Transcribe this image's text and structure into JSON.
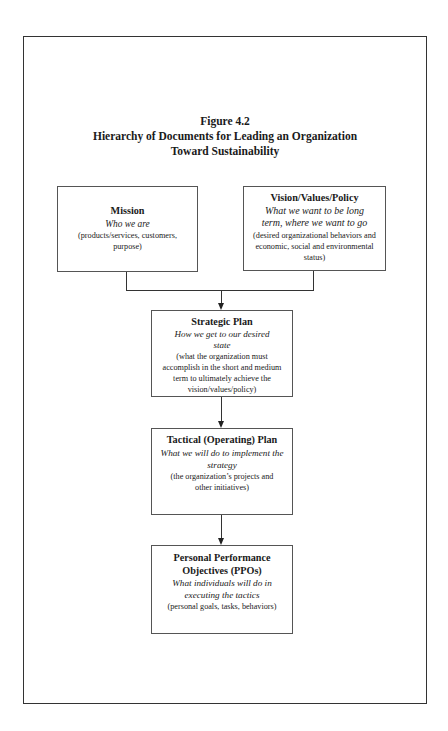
{
  "figure": {
    "number": "Figure 4.2",
    "title_line1": "Hierarchy of Documents for Leading an Organization",
    "title_line2": "Toward Sustainability"
  },
  "boxes": {
    "mission": {
      "heading": "Mission",
      "subtitle": "Who we are",
      "description": "(products/services, customers, purpose)"
    },
    "vision": {
      "heading": "Vision/Values/Policy",
      "subtitle": "What we want to be long term, where we want to go",
      "description": "(desired organizational behaviors and economic, social and environmental status)"
    },
    "strategic": {
      "heading": "Strategic Plan",
      "subtitle": "How we get to our desired state",
      "description": "(what the organization must accomplish in the short and medium term to ultimately achieve the vision/values/policy)"
    },
    "tactical": {
      "heading": "Tactical (Operating) Plan",
      "subtitle": "What we will do to implement the strategy",
      "description": "(the organization’s projects and other initiatives)"
    },
    "ppo": {
      "heading": "Personal Performance Objectives (PPOs)",
      "subtitle": "What individuals will do in executing the tactics",
      "description": "(personal goals, tasks, behaviors)"
    }
  },
  "connectors": [
    {
      "from": "mission",
      "to": "strategic"
    },
    {
      "from": "vision",
      "to": "strategic"
    },
    {
      "from": "strategic",
      "to": "tactical"
    },
    {
      "from": "tactical",
      "to": "ppo"
    }
  ]
}
